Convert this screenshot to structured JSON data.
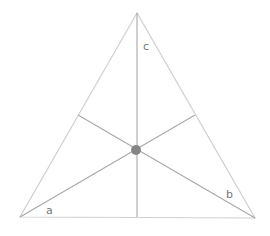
{
  "diagram": {
    "type": "triangle-medians-centroid",
    "labels": {
      "a": "a",
      "b": "b",
      "c": "c"
    },
    "colors": {
      "triangle": "#d0d0d0",
      "medians": "#a8a8a8",
      "centroid": "#858585",
      "label": "#777777"
    }
  }
}
